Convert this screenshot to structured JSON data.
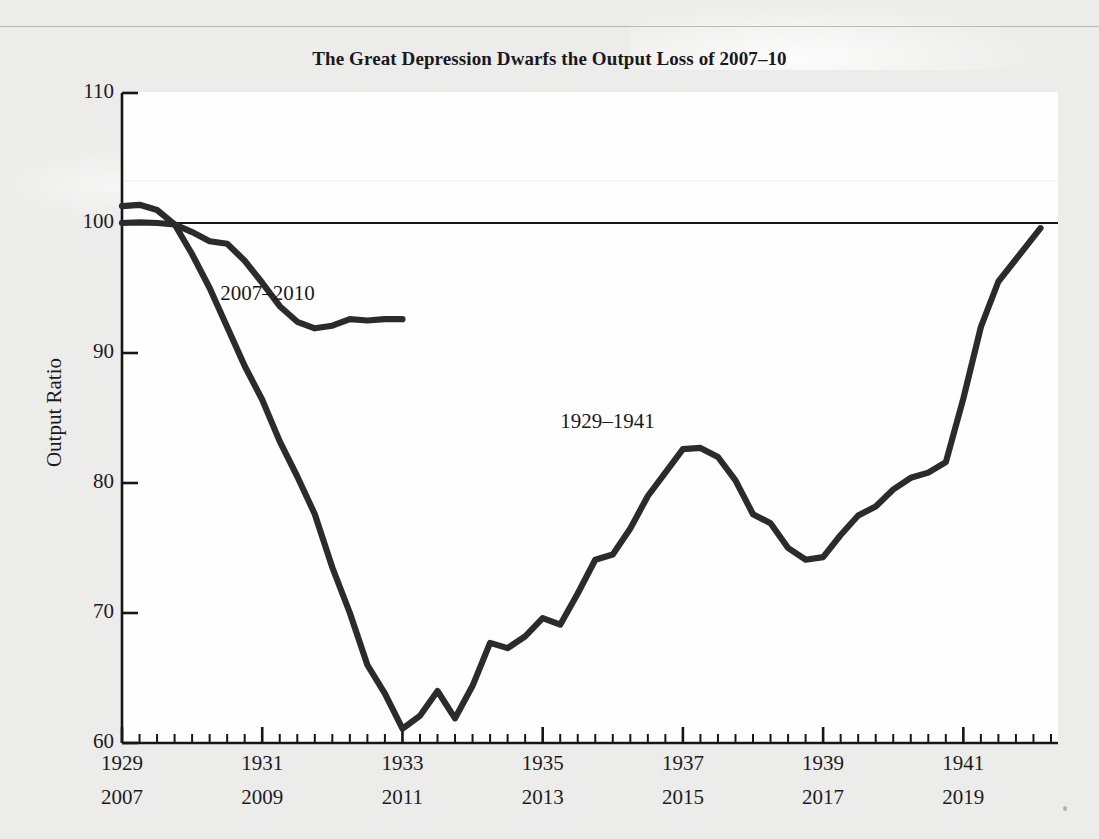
{
  "chart_data": {
    "type": "line",
    "title": "The Great Depression Dwarfs the Output Loss of 2007–10",
    "xlabel": "",
    "ylabel": "Output Ratio",
    "ylim": [
      60,
      110
    ],
    "yticks": [
      60,
      70,
      80,
      90,
      100,
      110
    ],
    "ytick_labels": [
      "60",
      "70",
      "80",
      "90",
      "100",
      "110"
    ],
    "grid": false,
    "legend_position": "inline-annotation",
    "x_axis_primary": {
      "name": "Great Depression years",
      "tick_labels": [
        "1929",
        "1931",
        "1933",
        "1935",
        "1937",
        "1939",
        "1941"
      ],
      "tick_values": [
        1929,
        1931,
        1933,
        1935,
        1937,
        1939,
        1941
      ]
    },
    "x_axis_secondary": {
      "name": "Great Recession years",
      "tick_labels": [
        "2007",
        "2009",
        "2011",
        "2013",
        "2015",
        "2017",
        "2019"
      ],
      "tick_values": [
        2007,
        2009,
        2011,
        2013,
        2015,
        2017,
        2019
      ]
    },
    "minor_tick_interval_quarters": 1,
    "reference_line": {
      "value": 100,
      "label": "",
      "color": "#161616"
    },
    "series": [
      {
        "name": "1929–1941",
        "annotation": "1929–1941",
        "annotation_x": 1936.05,
        "annotation_y": 84.6,
        "color": "#2b2b2b",
        "x": [
          1929.0,
          1929.25,
          1929.5,
          1929.75,
          1930.0,
          1930.25,
          1930.5,
          1930.75,
          1931.0,
          1931.25,
          1931.5,
          1931.75,
          1932.0,
          1932.25,
          1932.5,
          1932.75,
          1933.0,
          1933.25,
          1933.5,
          1933.75,
          1934.0,
          1934.25,
          1934.5,
          1934.75,
          1935.0,
          1935.25,
          1935.5,
          1935.75,
          1936.0,
          1936.25,
          1936.5,
          1936.75,
          1937.0,
          1937.25,
          1937.5,
          1937.75,
          1938.0,
          1938.25,
          1938.5,
          1938.75,
          1939.0,
          1939.25,
          1939.5,
          1939.75,
          1940.0,
          1940.25,
          1940.5,
          1940.75,
          1941.0,
          1941.25,
          1941.5
        ],
        "y": [
          101.3,
          101.4,
          101.0,
          99.9,
          97.6,
          95.0,
          92.0,
          89.0,
          86.4,
          83.2,
          80.5,
          77.6,
          73.5,
          70.0,
          66.0,
          63.8,
          61.1,
          62.1,
          64.0,
          61.9,
          64.4,
          67.7,
          67.3,
          68.2,
          69.6,
          69.1,
          71.5,
          74.1,
          74.5,
          76.5,
          79.0,
          80.8,
          82.6,
          82.7,
          82.0,
          80.2,
          77.6,
          76.9,
          75.0,
          74.1,
          74.3,
          76.0,
          77.5,
          78.2,
          79.5,
          80.4,
          80.8,
          81.6,
          86.5,
          92.0,
          95.5
        ]
      },
      {
        "name": "2007–2010",
        "annotation": "2007–2010",
        "annotation_x": 1931.2,
        "annotation_y": 94.5,
        "color": "#2b2b2b",
        "x": [
          1929.0,
          1929.25,
          1929.5,
          1929.75,
          1930.0,
          1930.25,
          1930.5,
          1930.75,
          1931.0,
          1931.25,
          1931.5,
          1931.75,
          1932.0,
          1932.25,
          1932.5,
          1932.75,
          1933.0
        ],
        "y": [
          100.0,
          100.05,
          100.0,
          99.9,
          99.3,
          98.6,
          98.4,
          97.1,
          95.4,
          93.6,
          92.4,
          91.9,
          92.1,
          92.6,
          92.5,
          92.6,
          92.6
        ]
      }
    ],
    "series_final_segment_note": {
      "name": "1929–1941 tail to 1942",
      "x_end": 1942.1,
      "y_end": 99.6
    }
  },
  "axis": {
    "ylabel": "Output Ratio",
    "ytick_labels": [
      "110",
      "100",
      "90",
      "80",
      "70",
      "60"
    ],
    "xtick_rows": [
      [
        "1929",
        "1931",
        "1933",
        "1935",
        "1937",
        "1939",
        "1941"
      ],
      [
        "2007",
        "2009",
        "2011",
        "2013",
        "2015",
        "2017",
        "2019"
      ]
    ]
  },
  "annotations": {
    "recession_label": "2007–2010",
    "depression_label": "1929–1941"
  }
}
